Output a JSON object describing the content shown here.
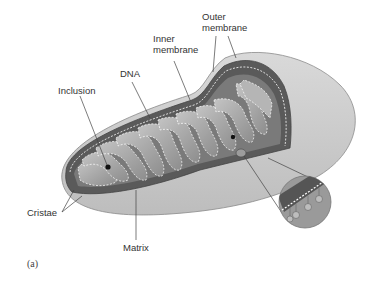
{
  "figure": {
    "panel_label": "(a)",
    "colors": {
      "background": "#ffffff",
      "outer_shell": "#cfcfcf",
      "outer_shell_shadow": "#b5b5b5",
      "membrane_dark": "#555555",
      "cristae_fill": "#9a9a9a",
      "cristae_light": "#bdbdbd",
      "dashed_line": "#ffffff",
      "leader_line": "#444444",
      "label_text": "#333333"
    }
  },
  "labels": {
    "outer_membrane_line1": "Outer",
    "outer_membrane_line2": "membrane",
    "inner_membrane_line1": "Inner",
    "inner_membrane_line2": "membrane",
    "dna": "DNA",
    "inclusion": "Inclusion",
    "cristae": "Cristae",
    "matrix": "Matrix"
  }
}
